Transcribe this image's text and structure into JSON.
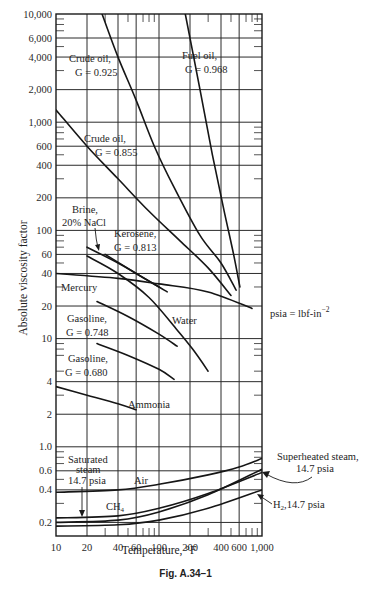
{
  "figure": {
    "caption": "Fig. A.34–1",
    "xlabel": "Temperature, °F",
    "ylabel": "Absolute  viscosity factor",
    "units_note": "psia = lbf-in",
    "units_note_exp": "−2"
  },
  "chart_data": {
    "type": "line",
    "title": "",
    "xlabel": "Temperature, °F",
    "ylabel": "Absolute viscosity factor",
    "xscale": "log",
    "yscale": "log",
    "xlim": [
      10,
      1000
    ],
    "ylim": [
      0.15,
      10000
    ],
    "grid": true,
    "x_ticks": [
      "10",
      "20",
      "40",
      "60",
      "100",
      "200",
      "400",
      "600",
      "1,000"
    ],
    "y_ticks": [
      "0.2",
      "0.4",
      "0.6",
      "1.0",
      "2",
      "4",
      "10",
      "20",
      "40",
      "60",
      "100",
      "200",
      "400",
      "600",
      "1,000",
      "2,000",
      "4,000",
      "6,000",
      "10,000"
    ],
    "series": [
      {
        "name": "Fuel oil, G = 0.968",
        "points": [
          [
            180,
            10000
          ],
          [
            250,
            2000
          ],
          [
            330,
            500
          ],
          [
            430,
            150
          ],
          [
            530,
            60
          ],
          [
            610,
            30
          ]
        ]
      },
      {
        "name": "Crude oil, G = 0.925",
        "points": [
          [
            28,
            10000
          ],
          [
            40,
            4000
          ],
          [
            60,
            1600
          ],
          [
            90,
            600
          ],
          [
            140,
            250
          ],
          [
            250,
            90
          ],
          [
            400,
            50
          ],
          [
            560,
            28
          ]
        ]
      },
      {
        "name": "Crude oil, G = 0.855",
        "points": [
          [
            10,
            1300
          ],
          [
            20,
            600
          ],
          [
            40,
            300
          ],
          [
            80,
            150
          ],
          [
            160,
            80
          ],
          [
            300,
            45
          ],
          [
            500,
            25
          ]
        ]
      },
      {
        "name": "Brine, 20% NaCl",
        "points": [
          [
            20,
            70
          ],
          [
            40,
            50
          ],
          [
            60,
            40
          ],
          [
            100,
            30
          ]
        ]
      },
      {
        "name": "Kerosene, G = 0.813",
        "points": [
          [
            30,
            60
          ],
          [
            60,
            40
          ],
          [
            100,
            30
          ],
          [
            120,
            27
          ]
        ]
      },
      {
        "name": "Mercury",
        "points": [
          [
            10,
            40
          ],
          [
            40,
            36
          ],
          [
            100,
            32
          ],
          [
            300,
            27
          ],
          [
            800,
            19
          ]
        ]
      },
      {
        "name": "Water",
        "points": [
          [
            20,
            58
          ],
          [
            40,
            40
          ],
          [
            80,
            24
          ],
          [
            150,
            12
          ],
          [
            212,
            8
          ],
          [
            300,
            5
          ]
        ]
      },
      {
        "name": "Gasoline, G = 0.748",
        "points": [
          [
            25,
            22
          ],
          [
            50,
            16
          ],
          [
            100,
            11
          ],
          [
            150,
            8.5
          ]
        ]
      },
      {
        "name": "Gasoline, G = 0.680",
        "points": [
          [
            25,
            9
          ],
          [
            50,
            7
          ],
          [
            100,
            5.2
          ],
          [
            140,
            4.2
          ]
        ]
      },
      {
        "name": "Ammonia",
        "points": [
          [
            10,
            3.6
          ],
          [
            20,
            3.0
          ],
          [
            40,
            2.5
          ],
          [
            60,
            2.2
          ]
        ]
      },
      {
        "name": "Air",
        "points": [
          [
            10,
            0.38
          ],
          [
            40,
            0.4
          ],
          [
            100,
            0.45
          ],
          [
            300,
            0.55
          ],
          [
            600,
            0.65
          ],
          [
            1000,
            0.78
          ]
        ]
      },
      {
        "name": "CH4",
        "points": [
          [
            10,
            0.22
          ],
          [
            40,
            0.23
          ],
          [
            100,
            0.27
          ],
          [
            300,
            0.37
          ],
          [
            1000,
            0.58
          ]
        ]
      },
      {
        "name": "Superheated steam, 14.7 psia",
        "points": [
          [
            10,
            0.2
          ],
          [
            40,
            0.21
          ],
          [
            100,
            0.25
          ],
          [
            300,
            0.36
          ],
          [
            1000,
            0.62
          ]
        ]
      },
      {
        "name": "H2, 14.7 psia",
        "points": [
          [
            10,
            0.185
          ],
          [
            40,
            0.19
          ],
          [
            100,
            0.21
          ],
          [
            300,
            0.27
          ],
          [
            1000,
            0.4
          ]
        ]
      },
      {
        "name": "Saturated steam, 14.7 psia",
        "points": [
          [
            18,
            0.25
          ],
          [
            18,
            0.21
          ]
        ]
      }
    ],
    "annotations": [
      "Crude oil, G = 0.925",
      "Fuel oil, G = 0.968",
      "Crude oil, G = 0.855",
      "Brine, 20% NaCl",
      "Kerosene, G = 0.813",
      "Mercury",
      "Gasoline, G = 0.748",
      "Water",
      "Gasoline, G = 0.680",
      "Ammonia",
      "Saturated steam 14.7 psia",
      "Air",
      "CH4",
      "Superheated steam, 14.7 psia",
      "H2, 14.7 psia",
      "psia = lbf-in^-2"
    ]
  },
  "labels": {
    "fuel_oil_1": "Fuel oil,",
    "fuel_oil_2": "G = 0.968",
    "crude925_1": "Crude oil,",
    "crude925_2": "G = 0.925",
    "crude855_1": "Crude oil,",
    "crude855_2": "G = 0.855",
    "brine_1": "Brine,",
    "brine_2": "20% NaCl",
    "kerosene_1": "Kerosene,",
    "kerosene_2": "G = 0.813",
    "mercury": "Mercury",
    "gas748_1": "Gasoline,",
    "gas748_2": "G = 0.748",
    "water": "Water",
    "gas680_1": "Gasoline,",
    "gas680_2": "G = 0.680",
    "ammonia": "Ammonia",
    "satsteam_1": "Saturated",
    "satsteam_2": "steam",
    "satsteam_3": "14.7 psia",
    "air": "Air",
    "ch4": "CH",
    "ch4_sub": "4",
    "superheated_1": "Superheated steam,",
    "superheated_2": "14.7 psia",
    "h2": "H",
    "h2_sub": "2",
    "h2_rest": ",14.7 psia"
  }
}
